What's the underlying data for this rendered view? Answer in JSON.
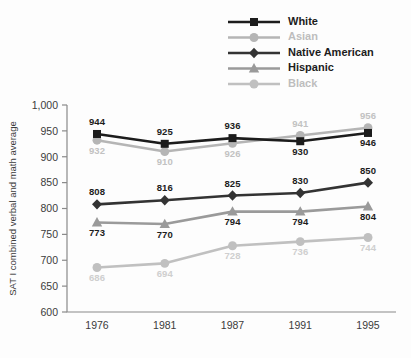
{
  "chart_data": {
    "type": "line",
    "title": "",
    "xlabel": "",
    "ylabel": "SAT I combined verbal and math average",
    "categories": [
      "1976",
      "1981",
      "1987",
      "1991",
      "1995"
    ],
    "ylim": [
      600,
      1000
    ],
    "yticks": [
      "600",
      "650",
      "700",
      "750",
      "800",
      "850",
      "900",
      "950",
      "1,000"
    ],
    "ytick_values": [
      600,
      650,
      700,
      750,
      800,
      850,
      900,
      950,
      1000
    ],
    "grid": false,
    "legend_position": "top-right",
    "series": [
      {
        "name": "White",
        "values": [
          944,
          925,
          936,
          930,
          946
        ],
        "labels": [
          "944",
          "925",
          "936",
          "930",
          "946"
        ],
        "color": "#1c1c1c",
        "marker": "square",
        "label_color": "#1c1c1c",
        "legend_text_color": "#1c1c1c",
        "label_pos": [
          "above",
          "above",
          "above",
          "below",
          "below"
        ]
      },
      {
        "name": "Asian",
        "values": [
          932,
          910,
          926,
          941,
          956
        ],
        "labels": [
          "932",
          "910",
          "926",
          "941",
          "956"
        ],
        "color": "#b5b5b5",
        "marker": "circle",
        "label_color": "#c2c2c2",
        "legend_text_color": "#bdbdbd",
        "label_pos": [
          "below",
          "below",
          "below",
          "above",
          "above"
        ]
      },
      {
        "name": "Native American",
        "values": [
          808,
          816,
          825,
          830,
          850
        ],
        "labels": [
          "808",
          "816",
          "825",
          "830",
          "850"
        ],
        "color": "#333333",
        "marker": "diamond",
        "label_color": "#1c1c1c",
        "legend_text_color": "#1c1c1c",
        "label_pos": [
          "above",
          "above",
          "above",
          "above",
          "above"
        ]
      },
      {
        "name": "Hispanic",
        "values": [
          773,
          770,
          794,
          794,
          804
        ],
        "labels": [
          "773",
          "770",
          "794",
          "794",
          "804"
        ],
        "color": "#9a9a9a",
        "marker": "triangle",
        "label_color": "#1c1c1c",
        "legend_text_color": "#1c1c1c",
        "label_pos": [
          "below",
          "below",
          "below",
          "below",
          "below"
        ]
      },
      {
        "name": "Black",
        "values": [
          686,
          694,
          728,
          736,
          744
        ],
        "labels": [
          "686",
          "694",
          "728",
          "736",
          "744"
        ],
        "color": "#c0c0c0",
        "marker": "circle",
        "label_color": "#cfcfcf",
        "legend_text_color": "#bdbdbd",
        "label_pos": [
          "below",
          "below",
          "below",
          "below",
          "below"
        ]
      }
    ]
  },
  "legend": {
    "items": [
      {
        "label": "White"
      },
      {
        "label": "Asian"
      },
      {
        "label": "Native American"
      },
      {
        "label": "Hispanic"
      },
      {
        "label": "Black"
      }
    ]
  },
  "axis": {
    "y_title": "SAT I combined verbal and math average"
  }
}
